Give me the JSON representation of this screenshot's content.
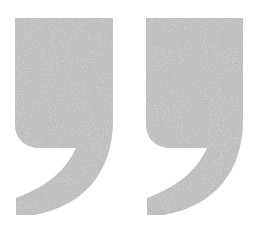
{
  "image": {
    "title": "Quotation mark glyph pair",
    "description": "Two large closing double-quotation-mark shapes rendered in light grey with a grainy speckled texture on a plain white background",
    "width": 264,
    "height": 230,
    "background_color": "#ffffff",
    "glyph_character": "”",
    "glyph_name": "right-double-quotation-mark",
    "texture": "grainy-noise",
    "fill_color": "#d4d4d4",
    "fill_color_light": "#dedede",
    "fill_color_dark": "#c6c6c6",
    "noise_color": "#b9b9b9"
  },
  "glyphs": [
    {
      "index": 1,
      "name": "left-quote-mark",
      "label": "comma-shape-left",
      "x": 15,
      "y": 18,
      "width": 98,
      "height": 197,
      "fill": "#d4d4d4",
      "path": "M 15 18 L 113 18 L 113 120 C 113 172 84 206 34 215 L 16 215 L 16 198 C 48 186 66 170 76 148 L 41 148 C 26 148 15 140 15 124 Z"
    },
    {
      "index": 2,
      "name": "right-quote-mark",
      "label": "comma-shape-right",
      "x": 146,
      "y": 18,
      "width": 97,
      "height": 197,
      "fill": "#d4d4d4",
      "path": "M 146 18 L 243 18 L 243 120 C 243 172 214 206 164 215 L 147 215 L 147 198 C 179 186 197 170 207 148 L 172 148 C 157 148 146 140 146 124 Z"
    }
  ]
}
